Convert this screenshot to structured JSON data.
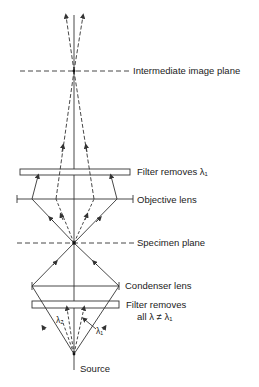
{
  "diagram": {
    "labels": {
      "intermediate_image_plane": "Intermediate image plane",
      "filter_top": "Filter removes λ₁",
      "objective_lens": "Objective lens",
      "specimen_plane": "Specimen plane",
      "condenser_lens": "Condenser lens",
      "filter_bottom_line1": "Filter removes",
      "filter_bottom_line2": "all λ ≠ λ₁",
      "source": "Source",
      "lambda2": "λ₂",
      "lambda1": "λ₁"
    },
    "colors": {
      "line": "#333333",
      "background": "#ffffff"
    }
  }
}
